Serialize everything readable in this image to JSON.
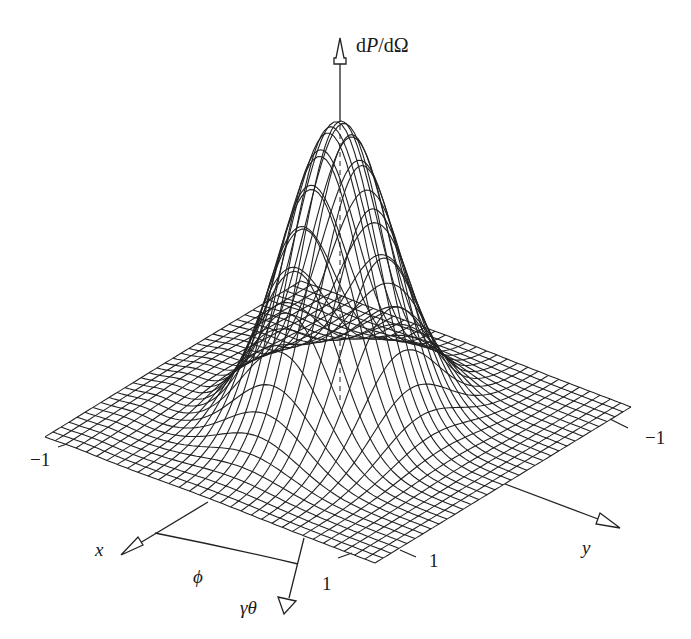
{
  "figure": {
    "title_axis_label": "dP/dΩ",
    "vertical_axis": {
      "label_prefix": "d",
      "label_italic": "P",
      "label_suffix": "/dΩ"
    },
    "x_axis": {
      "label": "x"
    },
    "y_axis": {
      "label": "y"
    },
    "phi_label": "ϕ",
    "gamma_theta_label": "γθ",
    "tick_labels": {
      "x_far": "−1",
      "y_far": "−1",
      "x_near": "1",
      "y_near": "1"
    },
    "line_color": "#222222",
    "background": "#ffffff"
  },
  "surface": {
    "description": "Wire-mesh plot of angular power distribution dP/dΩ versus γθ cosφ and γθ sinφ",
    "grid_range": [
      -1,
      1
    ],
    "grid_lines": 32,
    "function": "peaked bell-shaped distribution centered at origin, narrower along y than x",
    "peak_value_relative": 1.0
  }
}
